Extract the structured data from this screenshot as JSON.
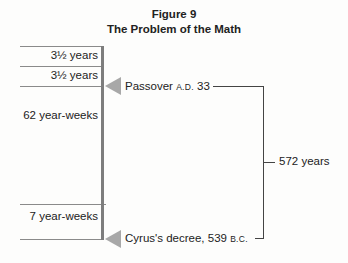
{
  "figure": {
    "number_label": "Figure 9",
    "title": "The Problem of the Math"
  },
  "timeline": {
    "segments": [
      {
        "label": "3½ years"
      },
      {
        "label": "3½ years"
      },
      {
        "label": "62 year-weeks"
      },
      {
        "label": "7 year-weeks"
      }
    ],
    "events": [
      {
        "name": "Passover",
        "era": "A.D.",
        "year": "33"
      },
      {
        "name": "Cyrus's decree,",
        "year": "539",
        "era": "B.C."
      }
    ],
    "span_label": "572 years"
  }
}
